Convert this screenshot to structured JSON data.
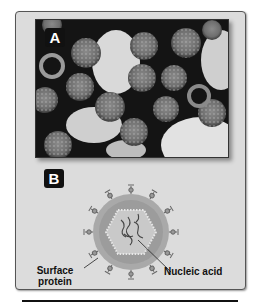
{
  "figure": {
    "panel_a": {
      "label": "A",
      "description": "Electron micrograph of spherical virus particles with spiky surfaces"
    },
    "panel_b": {
      "label": "B",
      "description": "Diagram of a virus particle",
      "callouts": {
        "surface_protein": [
          "Surface",
          "protein"
        ],
        "nucleic_acid": "Nucleic acid"
      }
    }
  },
  "colors": {
    "panel_bg": "#dcdcdc",
    "envelope": "#a8a8a8",
    "capsid": "#c8c8c8",
    "label_bg": "#111111"
  }
}
